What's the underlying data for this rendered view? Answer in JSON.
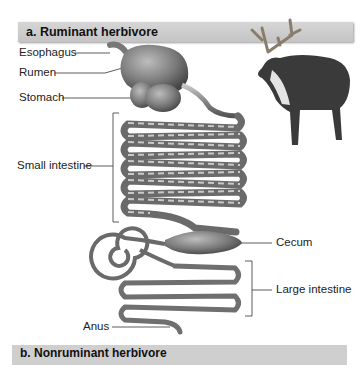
{
  "panel_a": {
    "title": "a. Ruminant herbivore",
    "animal": "reindeer-illustration",
    "labels": {
      "esophagus": "Esophagus",
      "rumen": "Rumen",
      "stomach": "Stomach",
      "small_intestine": "Small intestine",
      "cecum": "Cecum",
      "large_intestine": "Large intestine",
      "anus": "Anus"
    }
  },
  "panel_b": {
    "title": "b. Nonruminant herbivore"
  }
}
